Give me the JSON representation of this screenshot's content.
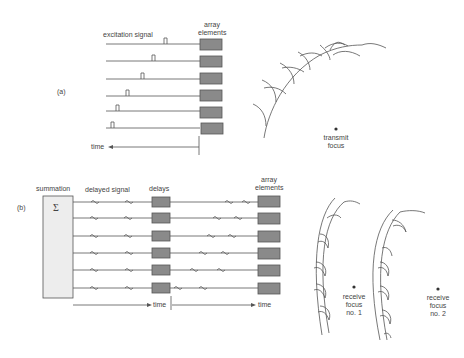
{
  "panel_a": {
    "label": "(a)",
    "excitation_signal": "excitation signal",
    "array_elements_line1": "array",
    "array_elements_line2": "elements",
    "time": "time",
    "transmit_focus_line1": "transmit",
    "transmit_focus_line2": "focus"
  },
  "panel_b": {
    "label": "(b)",
    "summation": "summation",
    "sigma": "Σ",
    "delayed_signal": "delayed signal",
    "delays": "delays",
    "array_elements_line1": "array",
    "array_elements_line2": "elements",
    "time_left": "time",
    "time_right": "time",
    "receive_focus_1": [
      "receive",
      "focus",
      "no. 1"
    ],
    "receive_focus_2": [
      "receive",
      "focus",
      "no. 2"
    ]
  },
  "colors": {
    "line": "#555555",
    "element_fill": "#8a8a8a",
    "summation_fill": "#ededed"
  }
}
